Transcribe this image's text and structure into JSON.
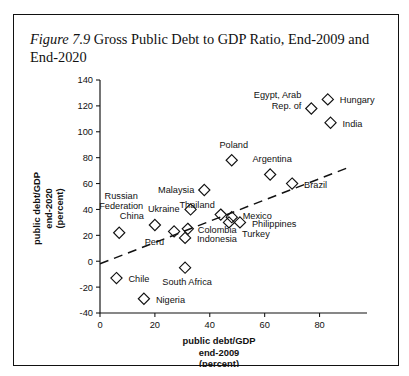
{
  "caption": {
    "figure_number": "Figure 7.9",
    "text": " Gross Public Debt to GDP Ratio, End-2009 and End-2020"
  },
  "chart_data": {
    "type": "scatter",
    "title": "Gross Public Debt to GDP Ratio, End-2009 and End-2020",
    "xlabel": "public debt/GDP end-2009 (percent)",
    "ylabel": "public debt/GDP end-2020 (percent)",
    "xlabel_lines": [
      "public debt/GDP",
      "end-2009",
      "(percent)"
    ],
    "ylabel_lines": [
      "public debt/GDP",
      "end-2020",
      "(percent)"
    ],
    "xlim": [
      0,
      90
    ],
    "ylim": [
      -40,
      140
    ],
    "xticks": [
      0,
      20,
      40,
      60,
      80
    ],
    "yticks": [
      -40,
      -20,
      0,
      20,
      40,
      60,
      80,
      100,
      120,
      140
    ],
    "grid": false,
    "legend": "none",
    "marker": "open-diamond",
    "points": [
      {
        "label": "Russian Federation",
        "x": 7,
        "y": 22,
        "label_lines": [
          "Russian",
          "Federation"
        ],
        "label_dx": 2,
        "label_dy": -34,
        "align": "middle"
      },
      {
        "label": "Chile",
        "x": 6,
        "y": -13,
        "label_lines": [
          "Chile"
        ],
        "label_dx": 12,
        "label_dy": 4,
        "align": "start"
      },
      {
        "label": "Nigeria",
        "x": 16,
        "y": -29,
        "label_lines": [
          "Nigeria"
        ],
        "label_dx": 12,
        "label_dy": 4,
        "align": "start"
      },
      {
        "label": "China",
        "x": 20,
        "y": 28,
        "label_lines": [
          "China"
        ],
        "label_dx": -11,
        "label_dy": -6,
        "align": "end"
      },
      {
        "label": "Peru",
        "x": 27,
        "y": 23,
        "label_lines": [
          "Peru"
        ],
        "label_dx": -10,
        "label_dy": 14,
        "align": "end"
      },
      {
        "label": "Colombia",
        "x": 32,
        "y": 25,
        "label_lines": [
          "Colombia"
        ],
        "label_dx": 10,
        "label_dy": 4,
        "align": "start"
      },
      {
        "label": "Indonesia",
        "x": 31,
        "y": 18,
        "label_lines": [
          "Indonesia"
        ],
        "label_dx": 12,
        "label_dy": 4,
        "align": "start"
      },
      {
        "label": "South Africa",
        "x": 31,
        "y": -5,
        "label_lines": [
          "South Africa"
        ],
        "label_dx": 2,
        "label_dy": 17,
        "align": "middle"
      },
      {
        "label": "Ukraine",
        "x": 33,
        "y": 40,
        "label_lines": [
          "Ukraine"
        ],
        "label_dx": -11,
        "label_dy": 3,
        "align": "end"
      },
      {
        "label": "Malaysia",
        "x": 38,
        "y": 55,
        "label_lines": [
          "Malaysia"
        ],
        "label_dx": -10,
        "label_dy": 3,
        "align": "end"
      },
      {
        "label": "Thailand",
        "x": 44,
        "y": 36,
        "label_lines": [
          "Thailand"
        ],
        "label_dx": -6,
        "label_dy": -7,
        "align": "end"
      },
      {
        "label": "Mexico",
        "x": 48,
        "y": 34,
        "label_lines": [
          "Mexico"
        ],
        "label_dx": 11,
        "label_dy": 2,
        "align": "start"
      },
      {
        "label": "Turkey",
        "x": 47,
        "y": 30,
        "label_lines": [
          "Turkey"
        ],
        "label_dx": 13,
        "label_dy": 15,
        "align": "start"
      },
      {
        "label": "Philippines",
        "x": 51,
        "y": 30,
        "label_lines": [
          "Philippines"
        ],
        "label_dx": 12,
        "label_dy": 5,
        "align": "start"
      },
      {
        "label": "Poland",
        "x": 48,
        "y": 78,
        "label_lines": [
          "Poland"
        ],
        "label_dx": 2,
        "label_dy": -12,
        "align": "middle"
      },
      {
        "label": "Argentina",
        "x": 62,
        "y": 67,
        "label_lines": [
          "Argentina"
        ],
        "label_dx": 2,
        "label_dy": -12,
        "align": "middle"
      },
      {
        "label": "Brazil",
        "x": 70,
        "y": 60,
        "label_lines": [
          "Brazil"
        ],
        "label_dx": 12,
        "label_dy": 4,
        "align": "start"
      },
      {
        "label": "Egypt, Arab Rep. of",
        "x": 77,
        "y": 118,
        "label_lines": [
          "Egypt, Arab",
          "Rep. of"
        ],
        "label_dx": -10,
        "label_dy": -10,
        "align": "end"
      },
      {
        "label": "Hungary",
        "x": 83,
        "y": 125,
        "label_lines": [
          "Hungary"
        ],
        "label_dx": 12,
        "label_dy": 4,
        "align": "start"
      },
      {
        "label": "India",
        "x": 84,
        "y": 107,
        "label_lines": [
          "India"
        ],
        "label_dx": 12,
        "label_dy": 4,
        "align": "start"
      }
    ],
    "trend_line": {
      "x0": 0,
      "y0": -2,
      "x1": 90,
      "y1": 72,
      "style": "dashed"
    }
  }
}
